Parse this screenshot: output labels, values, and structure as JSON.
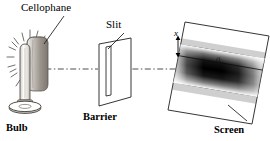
{
  "figure": {
    "title_visible": false,
    "type": "optics-ray-diagram",
    "background_color": "#ffffff",
    "line_color": "#1a1a1a",
    "band_color": "#000000"
  },
  "labels": {
    "cellophane": "Cellophane",
    "slit": "Slit",
    "bulb": "Bulb",
    "barrier": "Barrier",
    "screen": "Screen",
    "distance_x": "x",
    "center_zero": "0"
  },
  "components": [
    {
      "name": "bulb",
      "label": "Bulb",
      "description": "vertical tubular light bulb on round elliptical base with radiating light rays"
    },
    {
      "name": "cellophane",
      "label": "Cellophane",
      "description": "shaded cylindrical colored filter wrapped behind the bulb"
    },
    {
      "name": "barrier",
      "label": "Barrier",
      "description": "opaque parallelogram plate shown in perspective containing a narrow vertical slit"
    },
    {
      "name": "slit",
      "label": "Slit",
      "description": "narrow vertical aperture cut into the barrier"
    },
    {
      "name": "screen",
      "label": "Screen",
      "description": "parallelogram viewing screen in perspective showing the diffraction pattern"
    },
    {
      "name": "optical-axis",
      "label": "",
      "description": "horizontal dash-dot centerline from bulb through slit to screen center"
    }
  ],
  "annotations": [
    {
      "name": "distance-x",
      "text": "x",
      "description": "double-headed vertical arrow marking distance from pattern center to fringe"
    },
    {
      "name": "center-zero",
      "text": "0",
      "description": "origin marked at the center of the central bright band on the screen"
    }
  ]
}
